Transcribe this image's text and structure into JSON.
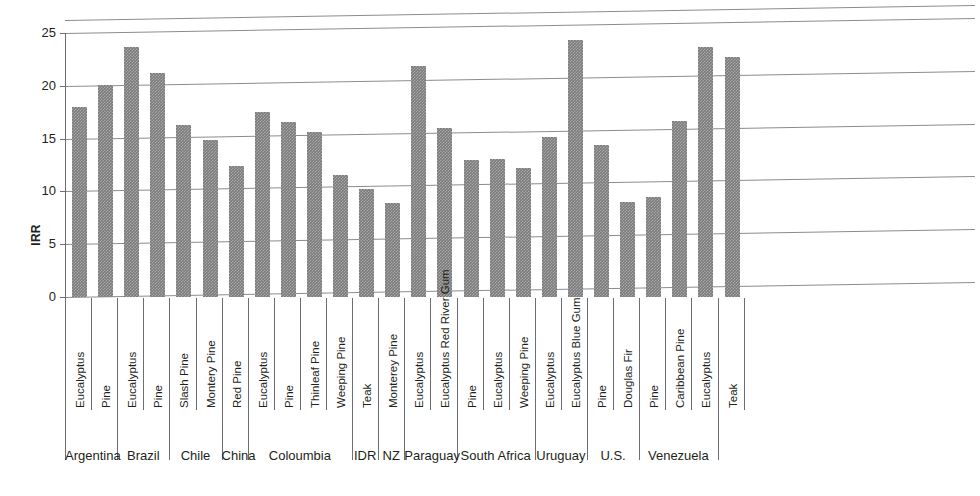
{
  "chart_data": {
    "type": "bar",
    "title": "",
    "xlabel": "",
    "ylabel": "IRR",
    "ylim": [
      0,
      25
    ],
    "yticks": [
      0,
      5,
      10,
      15,
      20,
      25
    ],
    "grid": true,
    "legend": "none",
    "categories": [
      "Eucalyptus",
      "Pine",
      "Eucalyptus",
      "Pine",
      "Slash Pine",
      "Montery Pine",
      "Red Pine",
      "Eucalyptus",
      "Pine",
      "Thinleaf Pine",
      "Weeping Pine",
      "Teak",
      "Monterey Pine",
      "Eucalyptus",
      "Eucalyptus Red River Gum",
      "Pine",
      "Eucalyptus",
      "Weeping Pine",
      "Eucalyptus",
      "Eucalyptus Blue Gum",
      "Pine",
      "Douglas Fir",
      "Pine",
      "Caribbean Pine",
      "Eucalyptus",
      "Teak"
    ],
    "values": [
      18.0,
      20.1,
      23.7,
      21.2,
      16.3,
      14.9,
      12.4,
      17.5,
      16.6,
      15.6,
      11.6,
      10.2,
      8.9,
      21.9,
      16.0,
      13.0,
      13.1,
      12.2,
      15.2,
      24.3,
      14.4,
      9.0,
      9.5,
      16.7,
      23.7,
      22.7
    ],
    "groups": [
      {
        "label": "Argentina",
        "count": 2
      },
      {
        "label": "Brazil",
        "count": 2
      },
      {
        "label": "Chile",
        "count": 2
      },
      {
        "label": "China",
        "count": 1
      },
      {
        "label": "Coloumbia",
        "count": 4
      },
      {
        "label": "IDR",
        "count": 1
      },
      {
        "label": "NZ",
        "count": 1
      },
      {
        "label": "Paraguay",
        "count": 2
      },
      {
        "label": "South Africa",
        "count": 3
      },
      {
        "label": "Uruguay",
        "count": 2
      },
      {
        "label": "U.S.",
        "count": 2
      },
      {
        "label": "Venezuela",
        "count": 3
      }
    ],
    "bar_color": "#7b7b7b",
    "axis_color": "#6d6e71",
    "gridline_color": "#8a8c8e",
    "background": "#ffffff"
  }
}
